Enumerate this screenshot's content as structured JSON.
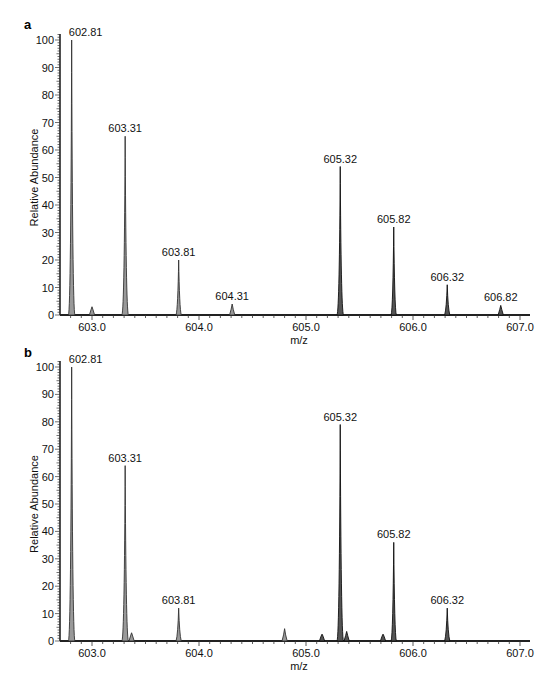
{
  "chart_data": [
    {
      "panel": "a",
      "type": "bar",
      "subtype": "mass-spectrum",
      "xlabel": "m/z",
      "ylabel": "Relative Abundance",
      "xlim": [
        602.7,
        607.05
      ],
      "ylim": [
        0,
        100
      ],
      "xticks": [
        "603.0",
        "604.0",
        "605.0",
        "606.0",
        "607.0"
      ],
      "yticks": [
        "0",
        "10",
        "20",
        "30",
        "40",
        "50",
        "60",
        "70",
        "80",
        "90",
        "100"
      ],
      "grid": false,
      "peaks": [
        {
          "mz": 602.81,
          "intensity": 100,
          "label": "602.81"
        },
        {
          "mz": 603.0,
          "intensity": 3,
          "label": ""
        },
        {
          "mz": 603.31,
          "intensity": 65,
          "label": "603.31"
        },
        {
          "mz": 603.81,
          "intensity": 20,
          "label": "603.81"
        },
        {
          "mz": 604.31,
          "intensity": 4,
          "label": "604.31"
        },
        {
          "mz": 605.32,
          "intensity": 54,
          "label": "605.32"
        },
        {
          "mz": 605.82,
          "intensity": 32,
          "label": "605.82"
        },
        {
          "mz": 606.32,
          "intensity": 11,
          "label": "606.32"
        },
        {
          "mz": 606.82,
          "intensity": 3.5,
          "label": "606.82"
        }
      ]
    },
    {
      "panel": "b",
      "type": "bar",
      "subtype": "mass-spectrum",
      "xlabel": "m/z",
      "ylabel": "Relative Abundance",
      "xlim": [
        602.7,
        607.05
      ],
      "ylim": [
        0,
        100
      ],
      "xticks": [
        "603.0",
        "604.0",
        "605.0",
        "606.0",
        "607.0"
      ],
      "yticks": [
        "0",
        "10",
        "20",
        "30",
        "40",
        "50",
        "60",
        "70",
        "80",
        "90",
        "100"
      ],
      "grid": false,
      "peaks": [
        {
          "mz": 602.81,
          "intensity": 100,
          "label": "602.81"
        },
        {
          "mz": 603.31,
          "intensity": 64,
          "label": "603.31"
        },
        {
          "mz": 603.37,
          "intensity": 3,
          "label": ""
        },
        {
          "mz": 603.81,
          "intensity": 12,
          "label": "603.81"
        },
        {
          "mz": 604.8,
          "intensity": 4.5,
          "label": ""
        },
        {
          "mz": 605.15,
          "intensity": 2.5,
          "label": ""
        },
        {
          "mz": 605.32,
          "intensity": 79,
          "label": "605.32"
        },
        {
          "mz": 605.38,
          "intensity": 3.5,
          "label": ""
        },
        {
          "mz": 605.72,
          "intensity": 2.5,
          "label": ""
        },
        {
          "mz": 605.82,
          "intensity": 36,
          "label": "605.82"
        },
        {
          "mz": 606.32,
          "intensity": 12,
          "label": "606.32"
        }
      ]
    }
  ],
  "panels": {
    "a": {
      "label": "a",
      "xlabel": "m/z",
      "ylabel": "Relative Abundance"
    },
    "b": {
      "label": "b",
      "xlabel": "m/z",
      "ylabel": "Relative Abundance"
    }
  }
}
